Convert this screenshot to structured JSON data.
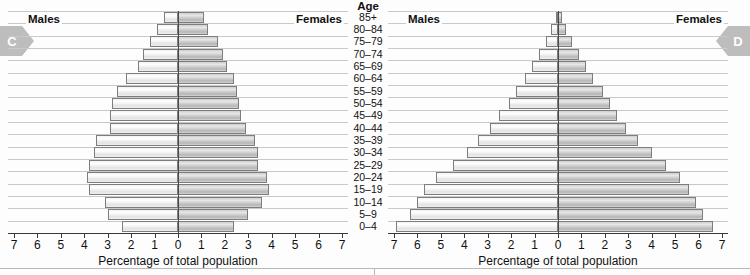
{
  "figure": {
    "age_axis_title": "Age",
    "bottom_rule": true
  },
  "markers": [
    {
      "label": "C",
      "side": "left",
      "color": "#bdbdbd"
    },
    {
      "label": "D",
      "side": "right",
      "color": "#bdbdbd"
    }
  ],
  "age_groups": [
    "85+",
    "80–84",
    "75–79",
    "70–74",
    "65–69",
    "60–64",
    "55–59",
    "50–54",
    "45–49",
    "40–44",
    "35–39",
    "30–34",
    "25–29",
    "20–24",
    "15–19",
    "10–14",
    "5–9",
    "0–4"
  ],
  "axis": {
    "title": "Percentage of total population",
    "ticks": [
      7,
      6,
      5,
      4,
      3,
      2,
      1,
      0,
      1,
      2,
      3,
      4,
      5,
      6,
      7
    ],
    "max": 7,
    "min": 0
  },
  "panels": [
    {
      "id": "C",
      "males_label": "Males",
      "females_label": "Females"
    },
    {
      "id": "D",
      "males_label": "Males",
      "females_label": "Females"
    }
  ],
  "chart_data": [
    {
      "type": "bar",
      "subtype": "population-pyramid",
      "panel": "C",
      "title": "",
      "xlabel": "Percentage of total population",
      "ylabel": "Age",
      "xlim": [
        0,
        7
      ],
      "grid": true,
      "legend_position": "in-plot-top-corners",
      "categories": [
        "85+",
        "80–84",
        "75–79",
        "70–74",
        "65–69",
        "60–64",
        "55–59",
        "50–54",
        "45–49",
        "40–44",
        "35–39",
        "30–34",
        "25–29",
        "20–24",
        "15–19",
        "10–14",
        "5–9",
        "0–4"
      ],
      "series": [
        {
          "name": "Males",
          "side": "left",
          "values": [
            0.6,
            0.9,
            1.2,
            1.5,
            1.7,
            2.2,
            2.6,
            2.8,
            2.9,
            2.9,
            3.5,
            3.6,
            3.8,
            3.9,
            3.8,
            3.1,
            3.0,
            2.4
          ]
        },
        {
          "name": "Females",
          "side": "right",
          "values": [
            1.1,
            1.3,
            1.7,
            1.9,
            2.1,
            2.4,
            2.5,
            2.6,
            2.7,
            2.9,
            3.3,
            3.4,
            3.4,
            3.8,
            3.9,
            3.6,
            3.0,
            2.4
          ]
        }
      ]
    },
    {
      "type": "bar",
      "subtype": "population-pyramid",
      "panel": "D",
      "title": "",
      "xlabel": "Percentage of total population",
      "ylabel": "Age",
      "xlim": [
        0,
        7
      ],
      "grid": true,
      "legend_position": "in-plot-top-corners",
      "categories": [
        "85+",
        "80–84",
        "75–79",
        "70–74",
        "65–69",
        "60–64",
        "55–59",
        "50–54",
        "45–49",
        "40–44",
        "35–39",
        "30–34",
        "25–29",
        "20–24",
        "15–19",
        "10–14",
        "5–9",
        "0–4"
      ],
      "series": [
        {
          "name": "Males",
          "side": "left",
          "values": [
            0.1,
            0.3,
            0.5,
            0.8,
            1.1,
            1.4,
            1.8,
            2.1,
            2.5,
            2.9,
            3.4,
            3.9,
            4.5,
            5.2,
            5.7,
            6.0,
            6.3,
            6.9
          ]
        },
        {
          "name": "Females",
          "side": "right",
          "values": [
            0.15,
            0.35,
            0.6,
            0.9,
            1.2,
            1.5,
            1.9,
            2.2,
            2.5,
            2.9,
            3.4,
            4.0,
            4.6,
            5.2,
            5.6,
            5.9,
            6.2,
            6.6
          ]
        }
      ]
    }
  ]
}
